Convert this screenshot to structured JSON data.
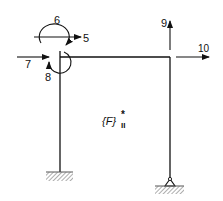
{
  "diagram": {
    "type": "structural-frame",
    "labels": {
      "dof_5": "5",
      "dof_6": "6",
      "dof_7": "7",
      "dof_8": "8",
      "dof_9": "9",
      "dof_10": "10"
    },
    "vector_label": {
      "base": "{F}",
      "superscript": "*",
      "subscript": "II"
    },
    "supports": {
      "left": "fixed",
      "right": "pin"
    },
    "colors": {
      "line": "#111111",
      "hatch": "#777777",
      "background": "#ffffff"
    }
  }
}
